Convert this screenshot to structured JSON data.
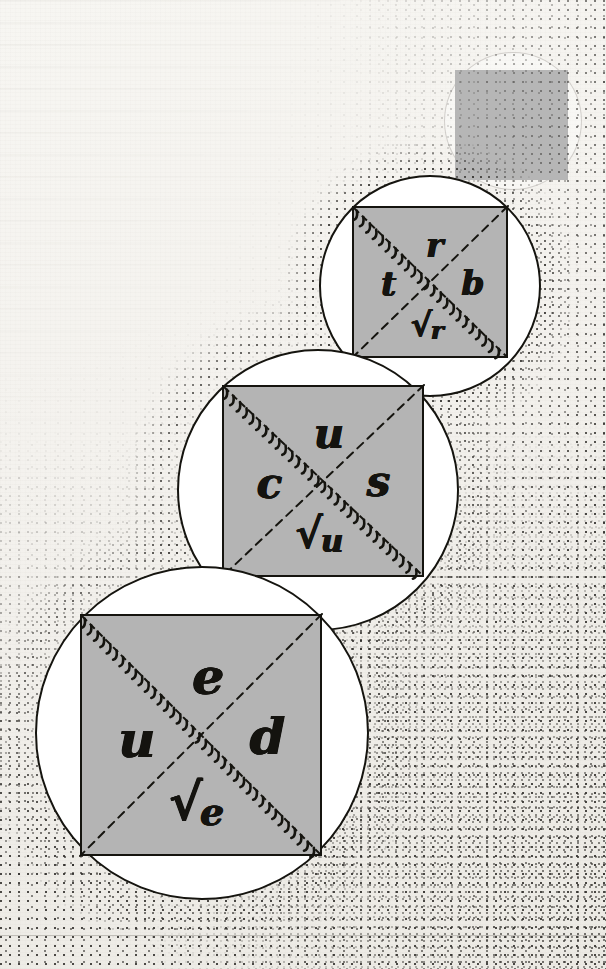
{
  "canvas": {
    "width": 606,
    "height": 969,
    "background_color": "#f2f0ec"
  },
  "palette": {
    "paper": "#f4f2ee",
    "ink": "#15140f",
    "square_fill": "#b4b4b4",
    "plain_square_fill": "#b6b6b6",
    "disc_fill": "#ffffff",
    "stipple": "#2e2c29",
    "ghost_outline": "#6e6962"
  },
  "figure": {
    "kind": "hand-drawn-diagram"
  },
  "units": [
    {
      "id": "unit-top",
      "order": 1,
      "circle": {
        "cx": 430,
        "cy": 286,
        "r": 111
      },
      "square": {
        "x": 352,
        "y": 206,
        "w": 156,
        "h": 152
      },
      "labels": {
        "top": "r",
        "left": "t",
        "right": "b",
        "bottom_surd": "√",
        "bottom_arg": "r"
      },
      "diagonals": [
        {
          "name": "hatched-diagonal",
          "from": "top-left",
          "to": "bottom-right",
          "style": "dashed-with-comb-teeth"
        },
        {
          "name": "plain-diagonal",
          "from": "top-right",
          "to": "bottom-left",
          "style": "dashed"
        }
      ]
    },
    {
      "id": "unit-middle",
      "order": 2,
      "circle": {
        "cx": 318,
        "cy": 490,
        "r": 141
      },
      "square": {
        "x": 222,
        "y": 385,
        "w": 202,
        "h": 192
      },
      "labels": {
        "top": "u",
        "left": "c",
        "right": "s",
        "bottom_surd": "√",
        "bottom_arg": "u"
      },
      "diagonals": [
        {
          "name": "hatched-diagonal",
          "from": "top-left",
          "to": "bottom-right",
          "style": "dashed-with-comb-teeth"
        },
        {
          "name": "plain-diagonal",
          "from": "top-right",
          "to": "bottom-left",
          "style": "dashed"
        }
      ]
    },
    {
      "id": "unit-bottom",
      "order": 3,
      "circle": {
        "cx": 202,
        "cy": 733,
        "r": 167
      },
      "square": {
        "x": 80,
        "y": 614,
        "w": 242,
        "h": 242
      },
      "labels": {
        "top": "e",
        "left": "u",
        "right": "d",
        "bottom_surd": "√",
        "bottom_arg": "e"
      },
      "diagonals": [
        {
          "name": "hatched-diagonal",
          "from": "top-left",
          "to": "bottom-right",
          "style": "dashed-with-comb-teeth"
        },
        {
          "name": "plain-diagonal",
          "from": "top-right",
          "to": "bottom-left",
          "style": "dashed"
        }
      ]
    }
  ],
  "plain_square": {
    "x": 455,
    "y": 70,
    "w": 113,
    "h": 110,
    "fill": "#b6b6b6"
  },
  "ghost_circle": {
    "cx": 512,
    "cy": 120,
    "r": 68
  },
  "page_rule": {
    "y": 935
  }
}
